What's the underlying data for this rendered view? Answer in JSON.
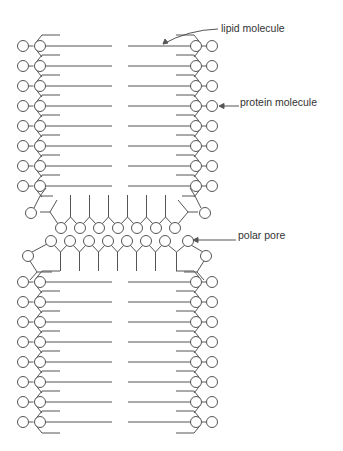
{
  "labels": {
    "lipid": {
      "text": "lipid molecule",
      "x": 221,
      "y": 22
    },
    "protein": {
      "text": "protein molecule",
      "x": 240,
      "y": 96
    },
    "pore": {
      "text": "polar pore",
      "x": 238,
      "y": 230
    }
  },
  "layout": {
    "top_rows": [
      46,
      66,
      86,
      106,
      126,
      146,
      166,
      186
    ],
    "bottom_rows": [
      282,
      302,
      322,
      342,
      362,
      382,
      402,
      422
    ],
    "left_outer_x": 23,
    "left_inner_x": 40,
    "right_inner_x": 196,
    "right_outer_x": 212,
    "tail_left_end": 112,
    "tail_right_start": 128,
    "pore_top_circles_x": [
      61,
      80,
      99,
      118,
      137,
      156,
      175
    ],
    "pore_top_y": 228,
    "pore_bottom_circles_x": [
      51,
      70,
      89,
      108,
      127,
      146,
      165,
      188
    ],
    "pore_bottom_y": 241,
    "circle_r": 5.5,
    "stroke_color": "#555555"
  }
}
